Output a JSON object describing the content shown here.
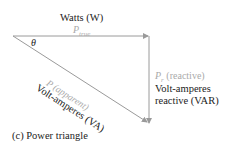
{
  "diagram": {
    "top_label": "Watts (W)",
    "p_true": "P",
    "p_true_sub": "true",
    "angle": "θ",
    "reactive_symbol": "P",
    "reactive_sub": "r",
    "reactive_label": "(reactive)",
    "reactive_unit_line1": "Volt-amperes",
    "reactive_unit_line2": "reactive (VAR)",
    "apparent_label": "P (apparent)",
    "apparent_unit": "Volt-amperes (VA)",
    "caption": "(c) Power triangle",
    "line_color": "#9a9a9a"
  }
}
